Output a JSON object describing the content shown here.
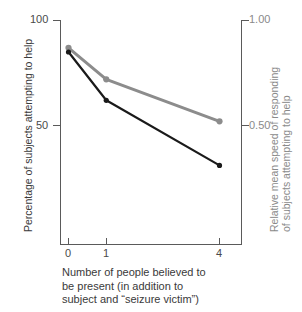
{
  "chart_data": {
    "type": "line",
    "title": "",
    "categories": [
      "0",
      "1",
      "4"
    ],
    "x": [
      0,
      1,
      4
    ],
    "xlabel": "Number of people believed to be present (in addition to subject and \"seizure victim\")",
    "xlabel_lines": [
      "Number of people believed to",
      "be present (in addition to",
      "subject and “seizure victim”)"
    ],
    "xtick_labels": [
      "0",
      "1",
      "4"
    ],
    "xlim": [
      -0.25,
      4.45
    ],
    "grid": false,
    "legend": "none",
    "axes": {
      "left": {
        "label": "Percentage of subjects attempting to help",
        "tick_labels": [
          "100",
          "50"
        ],
        "tick_values": [
          100,
          50
        ],
        "lim": [
          20,
          100
        ],
        "color": "#3a3a3a"
      },
      "right": {
        "label": "Relative mean speed of responding of subjects attempting to help",
        "label_lines": [
          "Relative mean speed of responding",
          "of subjects attempting to help"
        ],
        "tick_labels": [
          "1.00",
          "0.50"
        ],
        "tick_values": [
          1.0,
          0.5
        ],
        "lim": [
          0.2,
          1.0
        ],
        "color": "#8a8a8a"
      }
    },
    "series": [
      {
        "name": "Percentage of subjects attempting to help",
        "axis": "left",
        "color": "#1a1a1a",
        "marker": "circle",
        "values": [
          85,
          62,
          31
        ]
      },
      {
        "name": "Relative mean speed of responding",
        "axis": "right",
        "color": "#8c8c8c",
        "marker": "circle",
        "values": [
          0.87,
          0.72,
          0.52
        ]
      }
    ]
  },
  "colors": {
    "axis": "#5a5a5a",
    "black_series": "#1a1a1a",
    "gray_series": "#8c8c8c",
    "background": "#ffffff"
  }
}
